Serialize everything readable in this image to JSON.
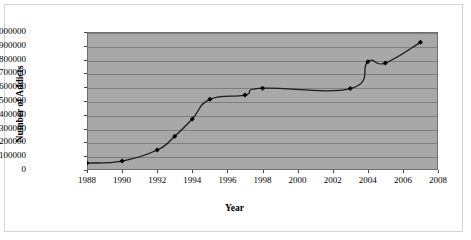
{
  "chart_data": {
    "type": "line",
    "title": "",
    "xlabel": "Year",
    "ylabel": "Number of Addicts",
    "xlim": [
      1988,
      2008
    ],
    "ylim": [
      0,
      1000000
    ],
    "grid": true,
    "legend": "none",
    "plot_background": "#a8a8a8",
    "line_color": "#1a1a1a",
    "marker": "diamond",
    "marker_color": "#000000",
    "x_tick_labels": [
      "1988",
      "1990",
      "1992",
      "1994",
      "1996",
      "1998",
      "2000",
      "2002",
      "2004",
      "2006",
      "2008"
    ],
    "x_tick_values": [
      1988,
      1990,
      1992,
      1994,
      1996,
      1998,
      2000,
      2002,
      2004,
      2006,
      2008
    ],
    "y_tick_labels": [
      "0",
      "100000",
      "200000",
      "300000",
      "400000",
      "500000",
      "600000",
      "700000",
      "800000",
      "900000",
      "1000000"
    ],
    "y_tick_values": [
      0,
      100000,
      200000,
      300000,
      400000,
      500000,
      600000,
      700000,
      800000,
      900000,
      1000000
    ],
    "x": [
      1988,
      1990,
      1992,
      1993,
      1994,
      1995,
      1997,
      1998,
      2003,
      2004,
      2005,
      2007
    ],
    "values": [
      50000,
      65000,
      145000,
      245000,
      370000,
      512000,
      543000,
      593000,
      590000,
      785000,
      775000,
      925000
    ],
    "series": [
      {
        "name": "Number of Addicts",
        "points": [
          {
            "year": 1988,
            "value": 50000
          },
          {
            "year": 1990,
            "value": 65000
          },
          {
            "year": 1992,
            "value": 145000
          },
          {
            "year": 1993,
            "value": 245000
          },
          {
            "year": 1994,
            "value": 370000
          },
          {
            "year": 1995,
            "value": 512000
          },
          {
            "year": 1997,
            "value": 543000
          },
          {
            "year": 1998,
            "value": 593000
          },
          {
            "year": 2003,
            "value": 590000
          },
          {
            "year": 2004,
            "value": 785000
          },
          {
            "year": 2005,
            "value": 775000
          },
          {
            "year": 2007,
            "value": 925000
          }
        ]
      }
    ]
  }
}
